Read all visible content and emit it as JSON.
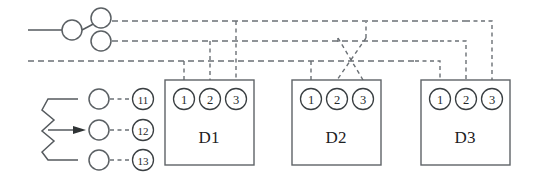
{
  "diagram": {
    "background_color": "#ffffff",
    "line_color_solid": "#555a5e",
    "line_color_dashed": "#6b7075",
    "text_color": "#24282a"
  },
  "switch": {
    "name": "changeover-switch",
    "common_label": "",
    "contact_upper_label": "",
    "contact_lower_label": ""
  },
  "potentiometer": {
    "name": "potentiometer",
    "symbol": "zigzag-resistor-with-wiper",
    "terminals": [
      {
        "label": "11"
      },
      {
        "label": "12"
      },
      {
        "label": "13"
      }
    ]
  },
  "devices": [
    {
      "name": "D1",
      "label": "D1",
      "terminals": [
        {
          "label": "1"
        },
        {
          "label": "2"
        },
        {
          "label": "3"
        }
      ]
    },
    {
      "name": "D2",
      "label": "D2",
      "terminals": [
        {
          "label": "1"
        },
        {
          "label": "2"
        },
        {
          "label": "3"
        }
      ]
    },
    {
      "name": "D3",
      "label": "D3",
      "terminals": [
        {
          "label": "1"
        },
        {
          "label": "2"
        },
        {
          "label": "3"
        }
      ]
    }
  ],
  "buses": [
    {
      "name": "bus-line-1",
      "y": 21
    },
    {
      "name": "bus-line-2",
      "y": 41
    },
    {
      "name": "bus-line-3",
      "y": 61
    }
  ]
}
